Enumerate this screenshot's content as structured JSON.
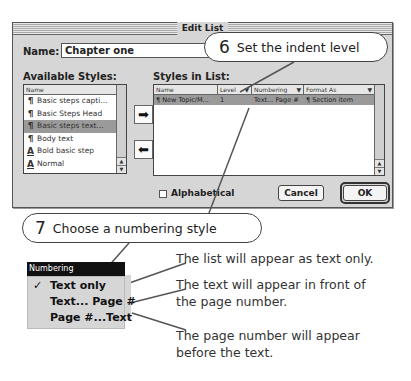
{
  "dialog": {
    "title": "Edit List",
    "name_label": "Name:",
    "name_value": "Chapter one",
    "available_styles_label": "Available Styles:",
    "available_styles": {
      "header": "Name",
      "items": [
        {
          "glyph": "¶",
          "label": "Basic steps capti...",
          "selected": false
        },
        {
          "glyph": "¶",
          "label": "Basic Steps Head",
          "selected": false
        },
        {
          "glyph": "¶",
          "label": "Basic steps text...",
          "selected": true
        },
        {
          "glyph": "¶",
          "label": "Body text",
          "selected": false
        },
        {
          "glyph": "A",
          "label": "Bold basic step",
          "selected": false
        },
        {
          "glyph": "A",
          "label": "Normal",
          "selected": false
        }
      ]
    },
    "move_right_icon": "➡",
    "move_left_icon": "⬅",
    "styles_in_list_label": "Styles in List:",
    "styles_in_list": {
      "headers": {
        "name": "Name",
        "level": "Level",
        "numbering": "Numbering",
        "format": "Format As"
      },
      "caret": "▼",
      "rows": [
        {
          "glyph": "¶",
          "name": "New Topic/M...",
          "level": "1",
          "numbering": "Text... Page #",
          "format_glyph": "¶",
          "format": "Section item"
        }
      ]
    },
    "alphabetical_label": "Alphabetical",
    "cancel_label": "Cancel",
    "ok_label": "OK"
  },
  "callouts": {
    "step6": {
      "number": "6",
      "text": "Set the indent level"
    },
    "step7": {
      "number": "7",
      "text": "Choose a numbering style"
    }
  },
  "numbering_menu": {
    "title": "Numbering",
    "check": "✓",
    "items": [
      {
        "label": "Text only",
        "checked": true
      },
      {
        "label": "Text... Page #",
        "checked": false
      },
      {
        "label": "Page #...Text",
        "checked": false
      }
    ]
  },
  "descriptions": {
    "text_only": "The list will appear as text only.",
    "text_page_line1": "The text will appear in front of",
    "text_page_line2": "the page number.",
    "page_text_line1": "The page number will appear",
    "page_text_line2": "before the text."
  },
  "colors": {
    "dialog_bg": "#d6d6d6",
    "selection": "#9a9a9a",
    "menu_title_bg": "#111111"
  }
}
